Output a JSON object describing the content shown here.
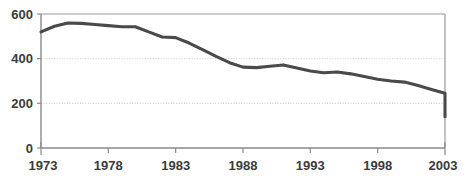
{
  "chart_data": {
    "type": "line",
    "title": "",
    "subtitle": "",
    "xlabel": "",
    "ylabel": "",
    "xlim": [
      1973,
      2003
    ],
    "ylim": [
      0,
      600
    ],
    "grid": true,
    "grid_values": [
      200,
      400
    ],
    "legend": null,
    "legend_position": "none",
    "y_ticks": [
      0,
      200,
      400,
      600
    ],
    "y_tick_labels": [
      "0",
      "200",
      "400",
      "600"
    ],
    "x_ticks": [
      1973,
      1978,
      1983,
      1988,
      1993,
      1998,
      2003
    ],
    "x_tick_labels": [
      "1973",
      "1978",
      "1983",
      "1988",
      "1993",
      "1998",
      "2003"
    ],
    "series": [
      {
        "name": "series-1",
        "color": "#4a4a4a",
        "x": [
          1973,
          1974,
          1975,
          1976,
          1977,
          1978,
          1979,
          1980,
          1981,
          1982,
          1983,
          1984,
          1985,
          1986,
          1987,
          1988,
          1989,
          1990,
          1991,
          1992,
          1993,
          1994,
          1995,
          1996,
          1997,
          1998,
          1999,
          2000,
          2001,
          2002,
          2003
        ],
        "values": [
          520,
          545,
          560,
          558,
          553,
          548,
          543,
          543,
          520,
          497,
          494,
          470,
          440,
          410,
          382,
          362,
          360,
          366,
          372,
          358,
          345,
          337,
          340,
          332,
          320,
          308,
          300,
          295,
          280,
          262,
          245
        ]
      }
    ],
    "values_tail": [
      225,
      205,
      185,
      168,
      152,
      142,
      140,
      148
    ]
  },
  "axes": {
    "y_axis_name": "y-axis",
    "x_axis_name": "x-axis"
  }
}
